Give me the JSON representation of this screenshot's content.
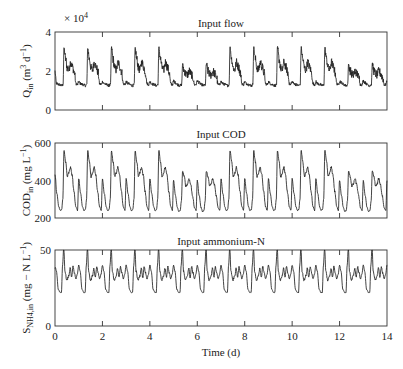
{
  "chart_data": [
    {
      "type": "line",
      "title": "Input flow",
      "ylabel": "Q_in (m^3 d^-1)",
      "ylabel_parts": {
        "sym": "Q",
        "sub": "in",
        "unit_pre": "(m",
        "sup1": "3",
        "unit_mid": " d",
        "sup2": "−1",
        "unit_post": ")"
      },
      "multiplier": "× 10",
      "multiplier_exp": "4",
      "ylim": [
        0,
        4
      ],
      "yticks": [
        0,
        2,
        4
      ],
      "ytick_labels": [
        "0",
        "2",
        "4"
      ],
      "xlim": [
        0,
        14
      ],
      "xticks": [
        0,
        2,
        4,
        6,
        8,
        10,
        12,
        14
      ],
      "units_scale": 10000,
      "daily_profile": {
        "t": [
          0.0,
          0.08,
          0.18,
          0.28,
          0.34,
          0.38,
          0.45,
          0.52,
          0.58,
          0.66,
          0.74,
          0.82,
          0.88,
          0.95,
          1.0
        ],
        "weekday": [
          1.45,
          1.35,
          1.3,
          1.25,
          1.3,
          3.2,
          2.6,
          2.15,
          2.05,
          2.45,
          2.2,
          1.9,
          1.35,
          1.3,
          1.45
        ],
        "weekend": [
          1.5,
          1.4,
          1.3,
          1.25,
          1.3,
          2.35,
          2.0,
          1.85,
          1.8,
          2.0,
          1.85,
          1.65,
          1.3,
          1.3,
          1.5
        ]
      },
      "noise_amplitude": 0.22,
      "initial_value": 2.0,
      "weekend_days": [
        5,
        6,
        12,
        13
      ]
    },
    {
      "type": "line",
      "title": "Input COD",
      "ylabel": "COD_in (mg L^-1)",
      "ylabel_parts": {
        "sym": "COD",
        "sub": "in",
        "unit_pre": "(mg L",
        "sup1": "",
        "unit_mid": "",
        "sup2": "−1",
        "unit_post": ")"
      },
      "ylim": [
        200,
        600
      ],
      "yticks": [
        200,
        400,
        600
      ],
      "ytick_labels": [
        "200",
        "400",
        "600"
      ],
      "xlim": [
        0,
        14
      ],
      "xticks": [
        0,
        2,
        4,
        6,
        8,
        10,
        12,
        14
      ],
      "units_scale": 1,
      "daily_profile": {
        "t": [
          0.0,
          0.08,
          0.16,
          0.22,
          0.28,
          0.33,
          0.38,
          0.45,
          0.52,
          0.58,
          0.65,
          0.72,
          0.8,
          0.88,
          0.95,
          1.0
        ],
        "weekday": [
          410,
          330,
          260,
          240,
          245,
          300,
          560,
          500,
          420,
          440,
          470,
          430,
          340,
          260,
          240,
          410
        ],
        "weekend": [
          400,
          320,
          255,
          235,
          240,
          290,
          450,
          420,
          370,
          380,
          410,
          380,
          320,
          255,
          240,
          400
        ]
      },
      "noise_amplitude": 6,
      "initial_value": 430,
      "weekend_days": [
        5,
        6,
        12,
        13
      ]
    },
    {
      "type": "line",
      "title": "Input ammonium-N",
      "ylabel": "S_NH4,in (mg − N L^-1)",
      "ylabel_parts": {
        "sym": "S",
        "sub": "NH4,in",
        "unit_pre": "(mg − N L",
        "sup1": "",
        "unit_mid": "",
        "sup2": "−1",
        "unit_post": ")"
      },
      "ylim": [
        0,
        50
      ],
      "yticks": [
        0,
        50
      ],
      "ytick_labels": [
        "0",
        "50"
      ],
      "xlim": [
        0,
        14
      ],
      "xticks": [
        0,
        2,
        4,
        6,
        8,
        10,
        12,
        14
      ],
      "xtick_labels": [
        "0",
        "2",
        "4",
        "6",
        "8",
        "10",
        "12",
        "14"
      ],
      "xlabel": "Time (d)",
      "units_scale": 1,
      "daily_profile": {
        "t": [
          0.0,
          0.06,
          0.14,
          0.22,
          0.27,
          0.32,
          0.37,
          0.42,
          0.5,
          0.58,
          0.64,
          0.7,
          0.76,
          0.82,
          0.88,
          0.94,
          1.0
        ],
        "weekday": [
          40,
          36,
          24,
          22,
          22,
          40,
          52,
          36,
          30,
          33,
          38,
          32,
          39,
          35,
          31,
          34,
          40
        ],
        "weekend": [
          40,
          36,
          24,
          22,
          22,
          40,
          52,
          36,
          30,
          33,
          38,
          32,
          39,
          35,
          31,
          34,
          40
        ]
      },
      "noise_amplitude": 0.6,
      "initial_value": 38,
      "weekend_days": []
    }
  ]
}
